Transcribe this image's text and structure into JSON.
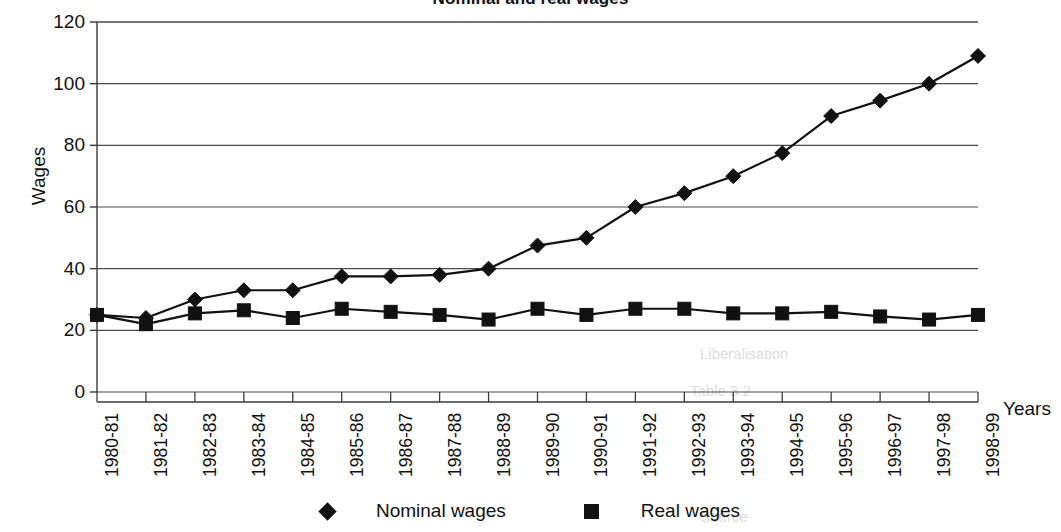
{
  "chart_data": {
    "type": "line",
    "title": "Nominal and real wages",
    "xlabel": "Years",
    "ylabel": "Wages",
    "ylim": [
      0,
      120
    ],
    "ytick_step": 20,
    "yticks": [
      0,
      20,
      40,
      60,
      80,
      100,
      120
    ],
    "grid": true,
    "legend_position": "bottom",
    "categories": [
      "1980-81",
      "1981-82",
      "1982-83",
      "1983-84",
      "1984-85",
      "1985-86",
      "1986-87",
      "1987-88",
      "1988-89",
      "1989-90",
      "1990-91",
      "1991-92",
      "1992-93",
      "1993-94",
      "1994-95",
      "1995-96",
      "1996-97",
      "1997-98",
      "1998-99"
    ],
    "series": [
      {
        "name": "Nominal wages",
        "marker": "diamond",
        "color": "#111111",
        "values": [
          25,
          24,
          30,
          33,
          33,
          37.5,
          37.5,
          38,
          40,
          47.5,
          50,
          60,
          64.5,
          70,
          77.5,
          89.5,
          94.5,
          100,
          109
        ]
      },
      {
        "name": "Real wages",
        "marker": "square",
        "color": "#111111",
        "values": [
          25,
          22,
          25.5,
          26.5,
          24,
          27,
          26,
          25,
          23.5,
          27,
          25,
          27,
          27,
          25.5,
          25.5,
          26,
          24.5,
          23.5,
          25
        ]
      }
    ]
  },
  "axes": {
    "y_title": "Wages",
    "x_title": "Years"
  },
  "legend": {
    "entries": [
      {
        "label": "Nominal wages",
        "marker": "diamond"
      },
      {
        "label": "Real wages",
        "marker": "square"
      }
    ]
  },
  "ghosts": [
    {
      "text": "Liberalisation",
      "x": 700,
      "y": 345
    },
    {
      "text": "Table 3.2",
      "x": 690,
      "y": 382
    },
    {
      "text": "Source",
      "x": 700,
      "y": 508
    }
  ]
}
